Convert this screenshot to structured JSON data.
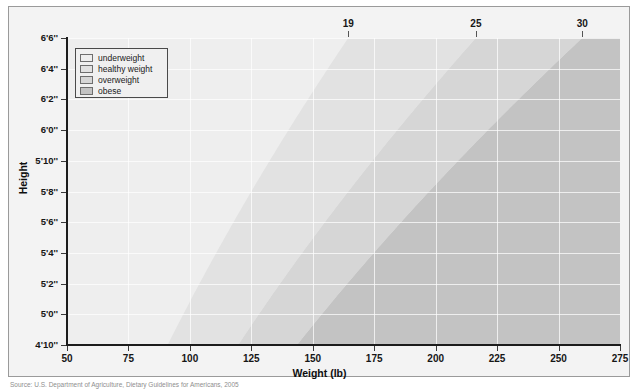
{
  "chart_data": {
    "type": "area",
    "title": "Body Mass Index (BMI)",
    "xlabel": "Weight (lb)",
    "ylabel": "Height",
    "xlim": [
      50,
      275
    ],
    "ylim_inches": [
      58,
      78
    ],
    "grid": true,
    "legend_position": "top-left",
    "xticks": [
      "50",
      "75",
      "100",
      "125",
      "150",
      "175",
      "200",
      "225",
      "250",
      "275"
    ],
    "xtick_values": [
      50,
      75,
      100,
      125,
      150,
      175,
      200,
      225,
      250,
      275
    ],
    "yticks": [
      "4'10''",
      "5'0''",
      "5'2''",
      "5'4''",
      "5'6''",
      "5'8''",
      "5'10''",
      "6'0''",
      "6'2''",
      "6'4''",
      "6'6''"
    ],
    "ytick_inches": [
      58,
      60,
      62,
      64,
      66,
      68,
      70,
      72,
      74,
      76,
      78
    ],
    "bmi_annotations": [
      {
        "label": "19",
        "bmi": 19
      },
      {
        "label": "25",
        "bmi": 25
      },
      {
        "label": "30",
        "bmi": 30
      }
    ],
    "bands": [
      {
        "name": "underweight",
        "bmi_range": [
          0,
          19
        ],
        "color": "#eeeeee"
      },
      {
        "name": "healthy weight",
        "bmi_range": [
          19,
          25
        ],
        "color": "#e2e2e2"
      },
      {
        "name": "overweight",
        "bmi_range": [
          25,
          30
        ],
        "color": "#d6d6d6"
      },
      {
        "name": "obese",
        "bmi_range": [
          30,
          99
        ],
        "color": "#c3c3c3"
      }
    ],
    "source": "Source: U.S. Department of Agriculture, Dietary Guidelines for Americans, 2005"
  },
  "legend": {
    "items": [
      {
        "label": "underweight",
        "color": "#eeeeee"
      },
      {
        "label": "healthy weight",
        "color": "#e2e2e2"
      },
      {
        "label": "overweight",
        "color": "#d6d6d6"
      },
      {
        "label": "obese",
        "color": "#c3c3c3"
      }
    ]
  },
  "titles": {
    "chart": "Body Mass Index (BMI)",
    "xaxis": "Weight (lb)",
    "yaxis": "Height"
  },
  "source_note": "Source: U.S. Department of Agriculture, Dietary Guidelines for Americans, 2005"
}
